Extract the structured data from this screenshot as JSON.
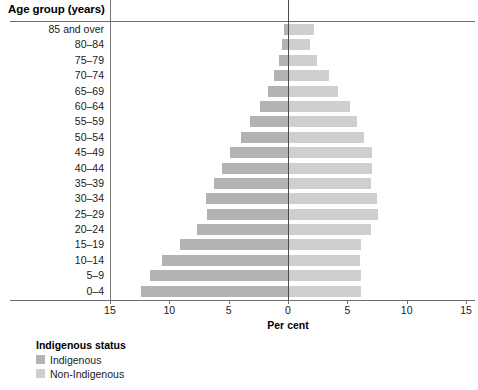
{
  "header": {
    "title": "Age group (years)"
  },
  "axis": {
    "x_title": "Per cent",
    "x_ticks": [
      "15",
      "10",
      "5",
      "0",
      "5",
      "10",
      "15"
    ]
  },
  "legend": {
    "title": "Indigenous status",
    "items": [
      {
        "label": "Indigenous",
        "color": "#b3b3b3",
        "key": "indigenous"
      },
      {
        "label": "Non-Indigenous",
        "color": "#cfcfcf",
        "key": "non-indigenous"
      }
    ]
  },
  "chart_data": {
    "type": "bar",
    "title": "Age group (years)",
    "subtitle": "",
    "xlabel": "Per cent",
    "ylabel": "Age group (years)",
    "orientation": "horizontal",
    "layout": "population-pyramid",
    "grid": false,
    "legend_position": "below-left",
    "xlim": [
      -15,
      15
    ],
    "xticks": [
      -15,
      -10,
      -5,
      0,
      5,
      10,
      15
    ],
    "xticklabels": [
      "15",
      "10",
      "5",
      "0",
      "5",
      "10",
      "15"
    ],
    "categories": [
      "85 and over",
      "80–84",
      "75–79",
      "70–74",
      "65–69",
      "60–64",
      "55–59",
      "50–54",
      "45–49",
      "40–44",
      "35–39",
      "30–34",
      "25–29",
      "20–24",
      "15–19",
      "10–14",
      "5–9",
      "0–4"
    ],
    "series": [
      {
        "name": "Indigenous",
        "side": "left",
        "color": "#b3b3b3",
        "values": [
          0.3,
          0.5,
          0.8,
          1.2,
          1.7,
          2.4,
          3.2,
          4.0,
          4.9,
          5.6,
          6.2,
          6.9,
          6.8,
          7.7,
          9.1,
          10.6,
          11.6,
          12.4
        ]
      },
      {
        "name": "Non-Indigenous",
        "side": "right",
        "color": "#cfcfcf",
        "values": [
          2.1,
          1.8,
          2.4,
          3.4,
          4.1,
          5.1,
          5.7,
          6.3,
          7.0,
          7.0,
          6.9,
          7.4,
          7.5,
          6.9,
          6.1,
          6.0,
          6.1,
          6.1
        ]
      }
    ]
  },
  "geometry": {
    "zero_x": 288,
    "px_per_unit": 11.87,
    "row_height": 15.4,
    "bar_height": 11
  }
}
